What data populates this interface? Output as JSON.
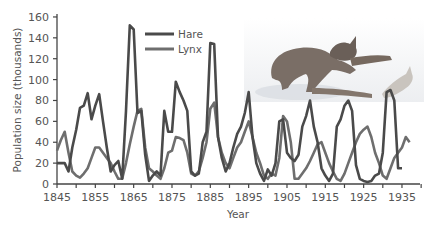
{
  "chart_data": {
    "type": "line",
    "title": "",
    "xlabel": "Year",
    "ylabel": "Population size (thousands)",
    "xlim": [
      1845,
      1937
    ],
    "ylim": [
      0,
      160
    ],
    "x_ticks": [
      1845,
      1855,
      1865,
      1875,
      1885,
      1895,
      1905,
      1915,
      1925,
      1935
    ],
    "y_ticks": [
      0,
      20,
      40,
      60,
      80,
      100,
      120,
      140,
      160
    ],
    "grid": false,
    "legend_position": "upper center",
    "series": [
      {
        "name": "Hare",
        "color": "#4a4a4a",
        "x": [
          1845,
          1846,
          1847,
          1848,
          1849,
          1850,
          1851,
          1852,
          1853,
          1854,
          1855,
          1856,
          1857,
          1858,
          1859,
          1860,
          1861,
          1862,
          1863,
          1864,
          1865,
          1866,
          1867,
          1868,
          1869,
          1870,
          1871,
          1872,
          1873,
          1874,
          1875,
          1876,
          1877,
          1878,
          1879,
          1880,
          1881,
          1882,
          1883,
          1884,
          1885,
          1886,
          1887,
          1888,
          1889,
          1890,
          1891,
          1892,
          1893,
          1894,
          1895,
          1896,
          1897,
          1898,
          1899,
          1900,
          1901,
          1902,
          1903,
          1904,
          1905,
          1906,
          1907,
          1908,
          1909,
          1910,
          1911,
          1912,
          1913,
          1914,
          1915,
          1916,
          1917,
          1918,
          1919,
          1920,
          1921,
          1922,
          1923,
          1924,
          1925,
          1926,
          1927,
          1928,
          1929,
          1930,
          1931,
          1932,
          1933,
          1934,
          1935
        ],
        "values": [
          20,
          20,
          20,
          12,
          35,
          52,
          73,
          75,
          87,
          62,
          75,
          86,
          60,
          35,
          12,
          18,
          22,
          5,
          70,
          152,
          148,
          68,
          70,
          28,
          3,
          8,
          12,
          8,
          70,
          50,
          50,
          98,
          88,
          80,
          70,
          12,
          8,
          10,
          40,
          50,
          135,
          134,
          45,
          25,
          12,
          20,
          35,
          48,
          55,
          68,
          88,
          45,
          20,
          10,
          3,
          14,
          8,
          20,
          60,
          62,
          30,
          25,
          22,
          28,
          55,
          65,
          80,
          55,
          40,
          15,
          8,
          3,
          10,
          55,
          62,
          75,
          80,
          70,
          18,
          5,
          3,
          2,
          3,
          8,
          10,
          30,
          88,
          90,
          80,
          15,
          15
        ],
        "x_end_note": "series plotted through ~1935"
      },
      {
        "name": "Lynx",
        "color": "#6e6e6e",
        "x": [
          1845,
          1846,
          1847,
          1848,
          1849,
          1850,
          1851,
          1852,
          1853,
          1854,
          1855,
          1856,
          1857,
          1858,
          1859,
          1860,
          1861,
          1862,
          1863,
          1864,
          1865,
          1866,
          1867,
          1868,
          1869,
          1870,
          1871,
          1872,
          1873,
          1874,
          1875,
          1876,
          1877,
          1878,
          1879,
          1880,
          1881,
          1882,
          1883,
          1884,
          1885,
          1886,
          1887,
          1888,
          1889,
          1890,
          1891,
          1892,
          1893,
          1894,
          1895,
          1896,
          1897,
          1898,
          1899,
          1900,
          1901,
          1902,
          1903,
          1904,
          1905,
          1906,
          1907,
          1908,
          1909,
          1910,
          1911,
          1912,
          1913,
          1914,
          1915,
          1916,
          1917,
          1918,
          1919,
          1920,
          1921,
          1922,
          1923,
          1924,
          1925,
          1926,
          1927,
          1928,
          1929,
          1930,
          1931,
          1932,
          1933,
          1934,
          1935,
          1936,
          1937
        ],
        "values": [
          32,
          42,
          50,
          30,
          12,
          8,
          6,
          10,
          15,
          25,
          35,
          35,
          30,
          25,
          20,
          12,
          5,
          5,
          20,
          38,
          55,
          70,
          72,
          35,
          15,
          12,
          8,
          5,
          15,
          30,
          32,
          45,
          44,
          42,
          30,
          10,
          8,
          12,
          25,
          40,
          72,
          78,
          45,
          30,
          20,
          15,
          25,
          35,
          40,
          50,
          60,
          45,
          30,
          20,
          8,
          5,
          10,
          8,
          25,
          65,
          60,
          40,
          5,
          5,
          10,
          15,
          22,
          30,
          38,
          40,
          30,
          20,
          12,
          5,
          3,
          10,
          20,
          30,
          40,
          48,
          52,
          55,
          45,
          30,
          20,
          8,
          5,
          15,
          25,
          30,
          35,
          45,
          40
        ]
      }
    ]
  },
  "legend": {
    "items": [
      {
        "label": "Hare",
        "color": "#4a4a4a"
      },
      {
        "label": "Lynx",
        "color": "#6e6e6e"
      }
    ]
  },
  "illustration": {
    "subject": "lynx-chasing-hare-illustration"
  }
}
